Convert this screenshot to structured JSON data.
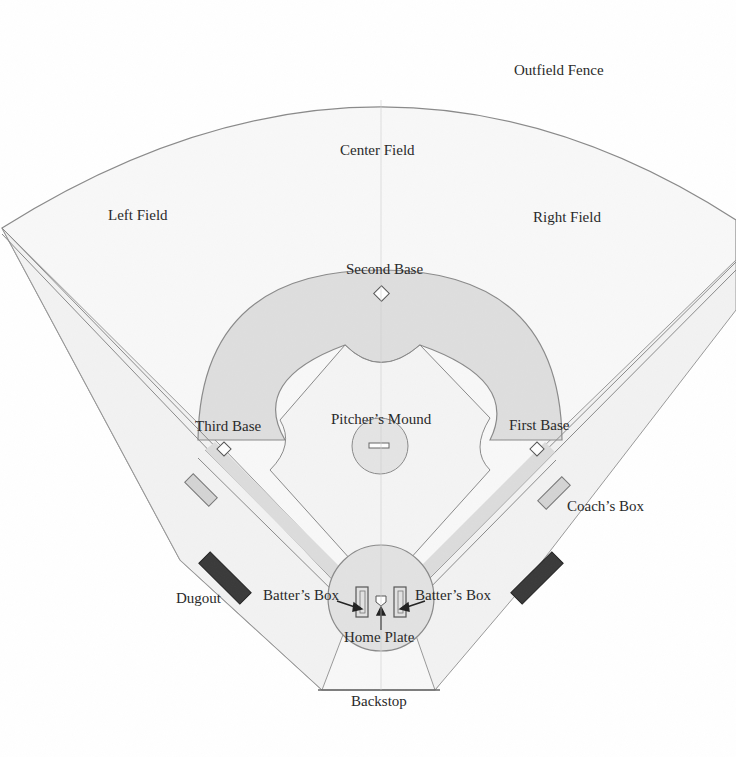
{
  "diagram": {
    "labels": {
      "outfield_fence": "Outfield Fence",
      "center_field": "Center Field",
      "left_field": "Left Field",
      "right_field": "Right Field",
      "second_base": "Second Base",
      "third_base": "Third Base",
      "first_base": "First Base",
      "pitchers_mound": "Pitcher’s Mound",
      "coachs_box": "Coach’s Box",
      "dugout": "Dugout",
      "batters_box_left": "Batter’s Box",
      "batters_box_right": "Batter’s Box",
      "home_plate": "Home Plate",
      "backstop": "Backstop"
    },
    "colors": {
      "grass": "#f7f7f7",
      "infield_dirt": "#dedede",
      "line": "#8a8a8a",
      "dugout": "#3a3a3a",
      "coach_box": "#d4d4d4",
      "text": "#2a2a2a"
    }
  }
}
